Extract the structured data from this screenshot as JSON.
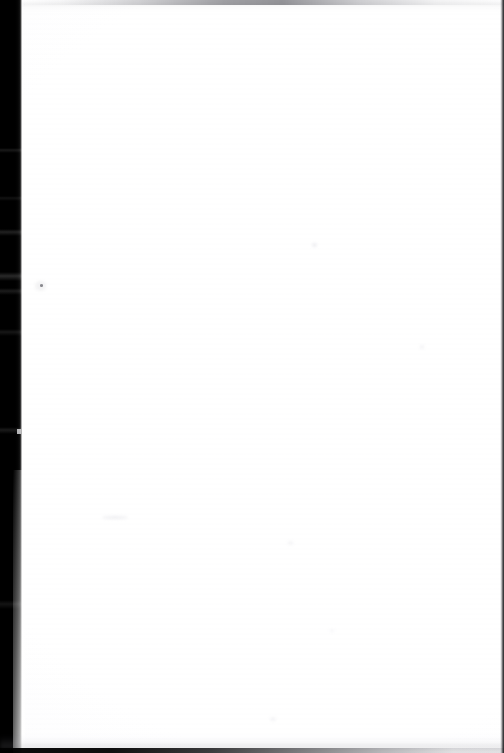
{
  "page": {
    "kind": "scanned-document-page",
    "content_state": "blank",
    "width": 504,
    "height": 753,
    "caption": "",
    "colors": {
      "paper": "#ffffff",
      "gutter_shadow": "#000000",
      "top_smear": "#3e3e46",
      "bottom_edge": "#000000",
      "right_edge": "#0a0a0c",
      "speck": "#5c5c64"
    }
  },
  "artifacts": {
    "gutter": {
      "name": "left-gutter-shadow",
      "edge": "left",
      "width_px": 22
    },
    "top_smear": {
      "name": "top-edge-smear",
      "edge": "top",
      "height_px": 5
    },
    "bottom_edge": {
      "name": "bottom-edge-line",
      "edge": "bottom",
      "height_px": 5
    },
    "right_edge": {
      "name": "right-edge-line",
      "edge": "right",
      "width_px": 4
    },
    "speck": {
      "name": "dust-speck",
      "x": 40,
      "y": 284
    }
  }
}
